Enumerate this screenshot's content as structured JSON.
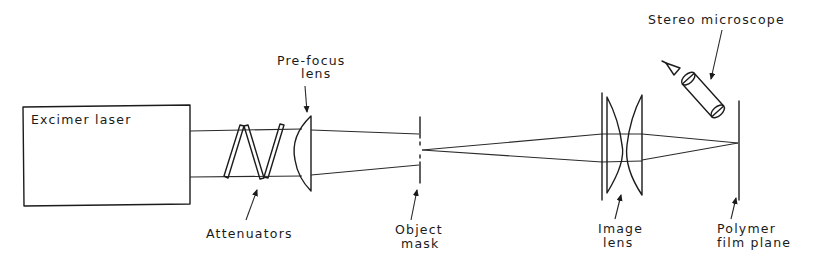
{
  "diagram": {
    "labels": {
      "laser": "Excimer laser",
      "prefocus_line1": "Pre-focus",
      "prefocus_line2": "lens",
      "attenuators": "Attenuators",
      "mask_line1": "Object",
      "mask_line2": "mask",
      "image_lens_line1": "Image",
      "image_lens_line2": "lens",
      "film_line1": "Polymer",
      "film_line2": "film plane",
      "microscope": "Stereo microscope"
    },
    "components": [
      "Excimer laser",
      "Attenuators",
      "Pre-focus lens",
      "Object mask",
      "Image lens",
      "Polymer film plane",
      "Stereo microscope"
    ],
    "colors": {
      "line": "#1c1c1c",
      "background": "#ffffff"
    }
  }
}
